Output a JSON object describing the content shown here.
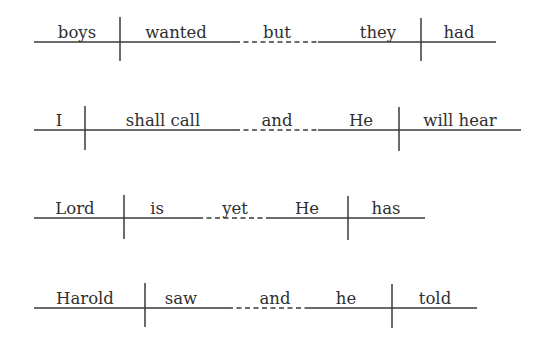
{
  "diagrams": [
    {
      "name": "diagram-boys-wanted-but-they-had",
      "baseline_y": 42,
      "words": [
        {
          "text": "boys",
          "x": 77
        },
        {
          "text": "wanted",
          "x": 176
        },
        {
          "text": "but",
          "x": 277
        },
        {
          "text": "they",
          "x": 378
        },
        {
          "text": "had",
          "x": 459
        }
      ],
      "solid1": [
        34,
        235
      ],
      "dashed": [
        235,
        318
      ],
      "solid2": [
        318,
        496
      ],
      "dividers": [
        120,
        421
      ],
      "divider_span": [
        17,
        61
      ]
    },
    {
      "name": "diagram-i-shall-call-and-he-will-hear",
      "baseline_y": 130,
      "words": [
        {
          "text": "I",
          "x": 59
        },
        {
          "text": "shall call",
          "x": 163
        },
        {
          "text": "and",
          "x": 277
        },
        {
          "text": "He",
          "x": 361
        },
        {
          "text": "will hear",
          "x": 460
        }
      ],
      "solid1": [
        34,
        235
      ],
      "dashed": [
        235,
        318
      ],
      "solid2": [
        318,
        521
      ],
      "dividers": [
        85,
        399
      ],
      "divider_span": [
        106,
        150
      ]
    },
    {
      "name": "diagram-lord-is-yet-he-has",
      "baseline_y": 218,
      "words": [
        {
          "text": "Lord",
          "x": 75
        },
        {
          "text": "is",
          "x": 157
        },
        {
          "text": "yet",
          "x": 235
        },
        {
          "text": "He",
          "x": 307
        },
        {
          "text": "has",
          "x": 386
        }
      ],
      "solid1": [
        34,
        198
      ],
      "dashed": [
        198,
        270
      ],
      "solid2": [
        270,
        425
      ],
      "dividers": [
        124,
        348
      ],
      "divider_span": [
        195,
        239
      ]
    },
    {
      "name": "diagram-harold-saw-and-he-told",
      "baseline_y": 308,
      "words": [
        {
          "text": "Harold",
          "x": 85
        },
        {
          "text": "saw",
          "x": 181
        },
        {
          "text": "and",
          "x": 275
        },
        {
          "text": "he",
          "x": 346
        },
        {
          "text": "told",
          "x": 435
        }
      ],
      "solid1": [
        34,
        228
      ],
      "dashed": [
        228,
        305
      ],
      "solid2": [
        305,
        477
      ],
      "dividers": [
        145,
        392
      ],
      "divider_span": [
        283,
        327
      ]
    }
  ]
}
